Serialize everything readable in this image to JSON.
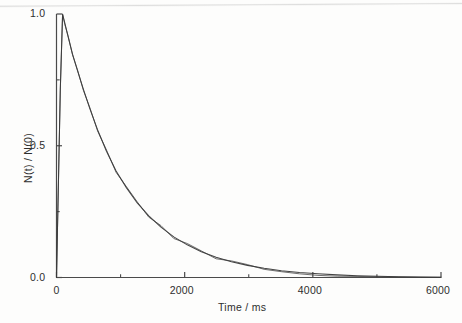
{
  "chart_data": {
    "type": "line",
    "title": "",
    "subtitle": "",
    "xlabel": "Time / ms",
    "ylabel": "N(t) / N(0)",
    "xlim": [
      0,
      6000
    ],
    "ylim": [
      0.0,
      1.0
    ],
    "grid": false,
    "legend": "none",
    "x_major_ticks": [
      0,
      2000,
      4000,
      6000
    ],
    "x_minor_ticks": [
      1000,
      3000,
      5000
    ],
    "y_major_ticks": [
      0.0,
      0.5,
      1.0
    ],
    "y_minor_ticks": [
      0.25,
      0.75
    ],
    "x_tick_labels": [
      "0",
      "2000",
      "4000",
      "6000"
    ],
    "y_tick_labels": [
      "0.0",
      "0.5",
      "1.0"
    ],
    "line_color": "#3a3a3a",
    "axis_color": "#4a4a4a",
    "background_color": "#fdfdfc",
    "annotations": [],
    "series": [
      {
        "name": "fit",
        "style": "smooth-exponential-fit",
        "description": "Single-exponential fit, tau approx 950 ms, rises from 0 at t=0 to 1.0 at t=95 ms then decays",
        "x": [
          0,
          30,
          60,
          95,
          130,
          180,
          250,
          330,
          420,
          520,
          640,
          780,
          930,
          1090,
          1260,
          1440,
          1630,
          1830,
          2040,
          2260,
          2490,
          2730,
          2980,
          3240,
          3510,
          3790,
          4080,
          4380,
          4690,
          5010,
          5340,
          5680,
          6000
        ],
        "y": [
          0.0,
          0.36,
          0.72,
          1.0,
          0.965,
          0.915,
          0.848,
          0.783,
          0.714,
          0.641,
          0.561,
          0.479,
          0.404,
          0.341,
          0.283,
          0.234,
          0.191,
          0.154,
          0.124,
          0.098,
          0.077,
          0.06,
          0.046,
          0.035,
          0.026,
          0.019,
          0.014,
          0.01,
          0.007,
          0.005,
          0.003,
          0.002,
          0.001
        ]
      },
      {
        "name": "data",
        "style": "noisy-experimental-trace",
        "description": "Experimental decay trace overlapping the fit, with small scatter that becomes visible beyond t approx 1600 ms and converges to baseline near t approx 4000 ms",
        "x": [
          0,
          30,
          60,
          95,
          130,
          180,
          250,
          330,
          420,
          520,
          640,
          780,
          930,
          1090,
          1260,
          1440,
          1630,
          1830,
          2040,
          2260,
          2490,
          2730,
          2980,
          3240,
          3510,
          3790,
          4080,
          4380,
          4690,
          5010,
          5340,
          5680,
          6000
        ],
        "y": [
          0.0,
          0.355,
          0.715,
          0.998,
          0.96,
          0.918,
          0.845,
          0.786,
          0.71,
          0.645,
          0.557,
          0.484,
          0.399,
          0.345,
          0.287,
          0.229,
          0.197,
          0.148,
          0.129,
          0.101,
          0.071,
          0.063,
          0.049,
          0.031,
          0.022,
          0.014,
          0.008,
          0.005,
          0.004,
          0.003,
          0.002,
          0.001,
          0.001
        ]
      }
    ]
  },
  "axes": {
    "x_title": "Time / ms",
    "y_title": "N(t) / N(0)",
    "x_labels": [
      "0",
      "2000",
      "4000",
      "6000"
    ],
    "y_labels": [
      "0.0",
      "0.5",
      "1.0"
    ]
  }
}
